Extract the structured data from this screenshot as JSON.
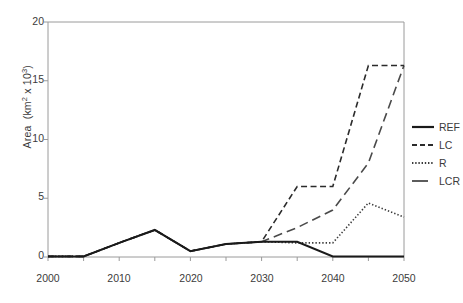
{
  "chart_data": {
    "type": "line",
    "title": "",
    "subtitle": "",
    "xlabel": "",
    "ylabel": "Area  (km² x 10³)",
    "ylabel_parts": {
      "prefix": "Area  (km",
      "sup1": "2",
      "mid": " x 10",
      "sup2": "3",
      "suffix": ")"
    },
    "xlim": [
      2000,
      2050
    ],
    "ylim": [
      0,
      20
    ],
    "yticks": [
      0,
      5,
      10,
      15,
      20
    ],
    "ytick_labels": [
      "0",
      "5",
      "10",
      "15",
      "20"
    ],
    "xticks": [
      2000,
      2005,
      2010,
      2015,
      2020,
      2025,
      2030,
      2035,
      2040,
      2045,
      2050
    ],
    "xtick_labels_shown": [
      "2000",
      "2010",
      "2020",
      "2030",
      "2040",
      "2050"
    ],
    "xtick_labels_positions": [
      2000,
      2010,
      2020,
      2030,
      2040,
      2050
    ],
    "grid": false,
    "legend_position": "right",
    "x": [
      2000,
      2005,
      2010,
      2015,
      2020,
      2025,
      2030,
      2035,
      2040,
      2045,
      2050
    ],
    "series": [
      {
        "name": "REF",
        "style": "solid",
        "color": "#1a1a1a",
        "width": 2.0,
        "values": [
          0.05,
          0.05,
          1.2,
          2.3,
          0.5,
          1.1,
          1.3,
          1.3,
          0.05,
          0.05,
          0.05
        ]
      },
      {
        "name": "LC",
        "style": "dashed",
        "color": "#2b2b2b",
        "width": 1.6,
        "values": [
          0.05,
          0.05,
          1.2,
          2.3,
          0.5,
          1.1,
          1.3,
          6.0,
          6.0,
          16.3,
          16.3
        ]
      },
      {
        "name": "R",
        "style": "dotted",
        "color": "#3a3a3a",
        "width": 1.6,
        "values": [
          0.05,
          0.05,
          1.2,
          2.3,
          0.5,
          1.1,
          1.3,
          1.2,
          1.2,
          4.6,
          3.4
        ]
      },
      {
        "name": "LCR",
        "style": "longdash",
        "color": "#4a4a4a",
        "width": 1.6,
        "values": [
          0.05,
          0.05,
          1.2,
          2.3,
          0.5,
          1.1,
          1.3,
          2.5,
          4.0,
          8.0,
          16.3
        ]
      }
    ]
  },
  "legend": {
    "entries": [
      {
        "label": "REF",
        "style": "solid"
      },
      {
        "label": "LC",
        "style": "dashed"
      },
      {
        "label": "R",
        "style": "dotted"
      },
      {
        "label": "LCR",
        "style": "longdash"
      }
    ]
  },
  "axes": {
    "y_ticks": [
      {
        "label": "20",
        "value": 20
      },
      {
        "label": "15",
        "value": 15
      },
      {
        "label": "10",
        "value": 10
      },
      {
        "label": "5",
        "value": 5
      },
      {
        "label": "0",
        "value": 0
      }
    ],
    "x_ticks": [
      {
        "label": "2000",
        "value": 2000
      },
      {
        "label": "2010",
        "value": 2010
      },
      {
        "label": "2020",
        "value": 2020
      },
      {
        "label": "2030",
        "value": 2030
      },
      {
        "label": "2040",
        "value": 2040
      },
      {
        "label": "2050",
        "value": 2050
      }
    ]
  },
  "colors": {
    "axis": "#9a9a9a",
    "text": "#3b3b3b",
    "ref": "#1a1a1a",
    "lc": "#2b2b2b",
    "r": "#3a3a3a",
    "lcr": "#4a4a4a",
    "background": "#ffffff"
  }
}
